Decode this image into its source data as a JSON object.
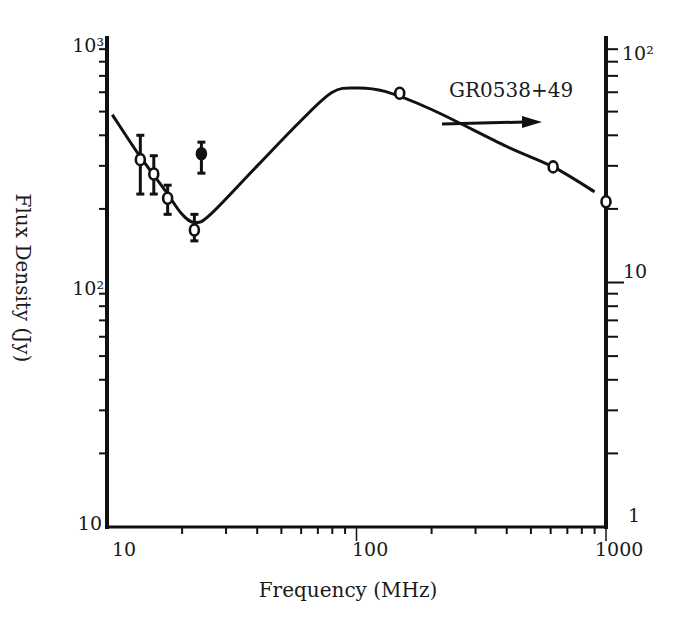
{
  "chart_data": {
    "type": "scatter",
    "title": "",
    "annotation": "GR0538+49",
    "xlabel": "Frequency (MHz)",
    "ylabel": "Flux Density (Jy)",
    "xscale": "log",
    "yscale": "log",
    "xlim": [
      10,
      1000
    ],
    "ylim_left": [
      10,
      1000
    ],
    "ylim_right": [
      1,
      100
    ],
    "x_ticks": [
      "10",
      "100",
      "1000"
    ],
    "y_ticks_left": [
      "10",
      "10²",
      "10³"
    ],
    "y_ticks_right": [
      "1",
      "10",
      "10²"
    ],
    "grid": false,
    "legend": null,
    "series": [
      {
        "name": "open-circle measurements",
        "marker": "open-circle",
        "points": [
          {
            "x": 13.6,
            "y": 318,
            "y_err_low": 230,
            "y_err_high": 400
          },
          {
            "x": 15.4,
            "y": 278,
            "y_err_low": 230,
            "y_err_high": 330
          },
          {
            "x": 17.5,
            "y": 221,
            "y_err_low": 190,
            "y_err_high": 250
          },
          {
            "x": 22.4,
            "y": 164,
            "y_err_low": 148,
            "y_err_high": 190
          },
          {
            "x": 149,
            "y": 594
          },
          {
            "x": 614,
            "y": 297
          },
          {
            "x": 1000,
            "y": 214
          }
        ]
      },
      {
        "name": "filled-circle measurement",
        "marker": "filled-circle",
        "points": [
          {
            "x": 23.9,
            "y": 336,
            "y_err_low": 280,
            "y_err_high": 375
          }
        ]
      },
      {
        "name": "fitted spectrum",
        "marker": "line",
        "points": [
          {
            "x": 10.5,
            "y": 486
          },
          {
            "x": 13.5,
            "y": 330
          },
          {
            "x": 17,
            "y": 240
          },
          {
            "x": 20,
            "y": 190
          },
          {
            "x": 22.5,
            "y": 176
          },
          {
            "x": 26,
            "y": 190
          },
          {
            "x": 40,
            "y": 300
          },
          {
            "x": 60,
            "y": 460
          },
          {
            "x": 80,
            "y": 600
          },
          {
            "x": 100,
            "y": 625
          },
          {
            "x": 130,
            "y": 605
          },
          {
            "x": 200,
            "y": 510
          },
          {
            "x": 400,
            "y": 360
          },
          {
            "x": 614,
            "y": 297
          },
          {
            "x": 900,
            "y": 235
          }
        ]
      }
    ],
    "arrow": {
      "from_x": 230,
      "to_x": 520,
      "at_y": 525,
      "direction": "right"
    }
  }
}
